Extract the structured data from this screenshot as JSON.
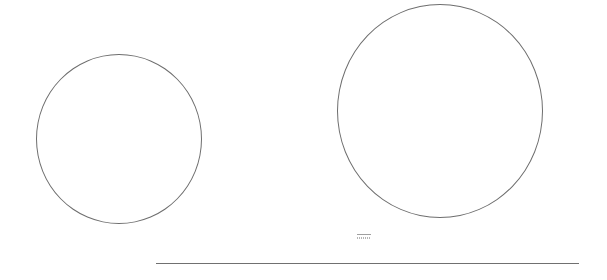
{
  "canvas": {
    "width": 607,
    "height": 280,
    "background": "#ffffff"
  },
  "shapes": {
    "circle_left": {
      "cx": 119,
      "cy": 139,
      "rx": 83,
      "ry": 85,
      "stroke": "#6e6e6e"
    },
    "circle_right": {
      "cx": 440,
      "cy": 111,
      "rx": 103,
      "ry": 107,
      "stroke": "#6e6e6e"
    },
    "baseline": {
      "x1": 156,
      "x2": 579,
      "y": 263,
      "stroke": "#707070"
    }
  },
  "icons": {
    "mini_icon": {
      "name": "small-text-graphic-icon",
      "x": 355,
      "y": 231
    }
  }
}
